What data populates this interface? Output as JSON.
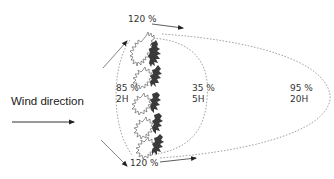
{
  "wind_label": "Wind direction",
  "colors": {
    "text": "#333333",
    "arrow": "#333333",
    "dashed_curve": "#999999",
    "tree_outline": "#555555",
    "tree_fill": "#3a3a3a"
  },
  "top_edge": {
    "value": "120 %"
  },
  "bottom_edge": {
    "value": "120 %"
  },
  "zones": [
    {
      "id": "upwind",
      "value": "85 %",
      "distance": "2H"
    },
    {
      "id": "near-leeward",
      "value": "35 %",
      "distance": "5H"
    },
    {
      "id": "far-leeward",
      "value": "95 %",
      "distance": "20H"
    }
  ],
  "icons": {
    "wind_arrow": "arrow-right-icon",
    "windbreak": "tree-row-icon"
  }
}
